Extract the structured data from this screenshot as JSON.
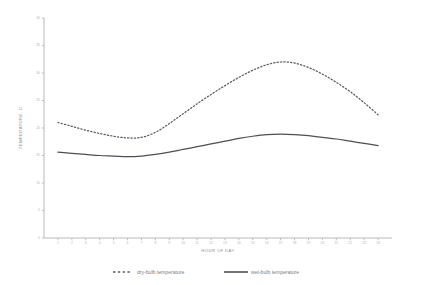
{
  "chart_data": {
    "type": "line",
    "title": "",
    "xlabel": "HOUR OF DAY",
    "ylabel": "TEMPERATURE, C",
    "xlim": [
      0,
      25
    ],
    "ylim": [
      0,
      40
    ],
    "grid": false,
    "legend_position": "bottom",
    "x_ticks": [
      1,
      2,
      3,
      4,
      5,
      6,
      7,
      8,
      9,
      10,
      11,
      12,
      13,
      14,
      15,
      16,
      17,
      18,
      19,
      20,
      21,
      22,
      23,
      24
    ],
    "y_ticks": [
      0,
      5,
      10,
      15,
      20,
      25,
      30,
      35,
      40
    ],
    "x": [
      1,
      2,
      3,
      4,
      5,
      6,
      7,
      8,
      9,
      10,
      11,
      12,
      13,
      14,
      15,
      16,
      17,
      18,
      19,
      20,
      21,
      22,
      23,
      24
    ],
    "series": [
      {
        "name": "dry-bulb temperature",
        "style": "dotted",
        "color": "#5b5b63",
        "values": [
          21.0,
          20.3,
          19.6,
          19.0,
          18.5,
          18.2,
          18.3,
          19.2,
          20.8,
          22.6,
          24.4,
          26.1,
          27.7,
          29.2,
          30.5,
          31.5,
          32.0,
          31.8,
          31.0,
          29.8,
          28.3,
          26.6,
          24.6,
          22.4
        ]
      },
      {
        "name": "wet-bulb temperature",
        "style": "solid",
        "color": "#4e4e56",
        "values": [
          15.6,
          15.4,
          15.2,
          15.0,
          14.9,
          14.8,
          14.9,
          15.2,
          15.6,
          16.1,
          16.6,
          17.1,
          17.6,
          18.1,
          18.5,
          18.8,
          18.9,
          18.8,
          18.6,
          18.3,
          18.0,
          17.6,
          17.2,
          16.8
        ]
      }
    ]
  },
  "legend": {
    "entries": [
      {
        "label": "dry-bulb temperature",
        "style": "dotted"
      },
      {
        "label": "wet-bulb temperature",
        "style": "solid"
      }
    ]
  }
}
